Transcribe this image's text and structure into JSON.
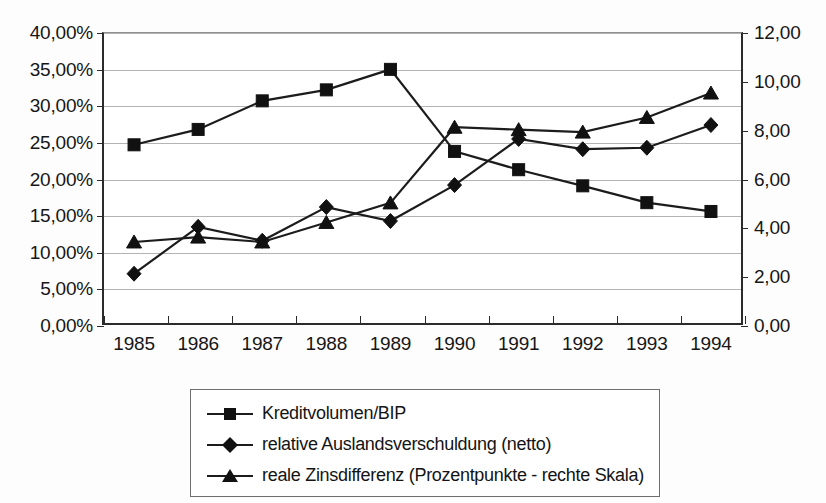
{
  "chart_data": {
    "type": "line",
    "title": "",
    "subtitle": "",
    "xlabel": "",
    "ylabel": "",
    "grid": true,
    "legend_position": "bottom",
    "categories": [
      "1985",
      "1986",
      "1987",
      "1988",
      "1989",
      "1990",
      "1991",
      "1992",
      "1993",
      "1994"
    ],
    "axes": {
      "left": {
        "label": "",
        "ylim": [
          0,
          40
        ],
        "tick_values": [
          0,
          5,
          10,
          15,
          20,
          25,
          30,
          35,
          40
        ],
        "tick_labels": [
          "0,00%",
          "5,00%",
          "10,00%",
          "15,00%",
          "20,00%",
          "25,00%",
          "30,00%",
          "35,00%",
          "40,00%"
        ]
      },
      "right": {
        "label": "",
        "ylim": [
          0,
          12
        ],
        "tick_values": [
          0,
          2,
          4,
          6,
          8,
          10,
          12
        ],
        "tick_labels": [
          "0,00",
          "2,00",
          "4,00",
          "6,00",
          "8,00",
          "10,00",
          "12,00"
        ]
      }
    },
    "series": [
      {
        "name": "Kreditvolumen/BIP",
        "marker": "square",
        "axis": "left",
        "values": [
          24.6,
          26.7,
          30.6,
          32.1,
          34.9,
          23.7,
          21.2,
          19.0,
          16.7,
          15.5
        ]
      },
      {
        "name": "relative Auslandsverschuldung (netto)",
        "marker": "diamond",
        "axis": "left",
        "values": [
          7.0,
          13.4,
          11.5,
          16.1,
          14.2,
          19.1,
          25.4,
          24.0,
          24.2,
          27.3
        ]
      },
      {
        "name": "reale Zinsdifferenz (Prozentpunkte - rechte Skala)",
        "marker": "triangle",
        "axis": "right",
        "values": [
          3.4,
          3.6,
          3.4,
          4.2,
          5.0,
          8.1,
          8.0,
          7.9,
          8.5,
          9.5
        ]
      }
    ]
  },
  "legend": {
    "items": [
      {
        "label": "Kreditvolumen/BIP",
        "marker": "square"
      },
      {
        "label": "relative Auslandsverschuldung (netto)",
        "marker": "diamond"
      },
      {
        "label": "reale Zinsdifferenz (Prozentpunkte - rechte Skala)",
        "marker": "triangle"
      }
    ]
  },
  "colors": {
    "series": "#111111",
    "grid": "#b4b4b4",
    "axis": "#2b2b2b",
    "background": "#ffffff"
  }
}
